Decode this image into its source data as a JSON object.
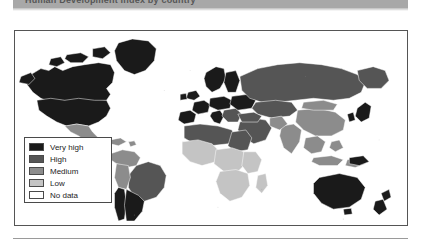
{
  "figure": {
    "banner_title": "Human Development Index by country",
    "banner_color": "#a8a8a8"
  },
  "legend": {
    "title": "",
    "items": [
      {
        "label": "Very high",
        "color": "#1a1a1a"
      },
      {
        "label": "High",
        "color": "#555555"
      },
      {
        "label": "Medium",
        "color": "#8c8c8c"
      },
      {
        "label": "Low",
        "color": "#c4c4c4"
      },
      {
        "label": "No data",
        "color": "#ffffff"
      }
    ]
  },
  "map": {
    "projection": "equirectangular",
    "frame_color": "#555555",
    "ocean_color": "#ffffff",
    "border_color": "#ffffff",
    "regions": [
      {
        "name": "canada",
        "class": "very-high"
      },
      {
        "name": "united-states",
        "class": "very-high"
      },
      {
        "name": "greenland",
        "class": "very-high"
      },
      {
        "name": "mexico",
        "class": "medium"
      },
      {
        "name": "central-america",
        "class": "medium"
      },
      {
        "name": "brazil",
        "class": "high"
      },
      {
        "name": "argentina",
        "class": "very-high"
      },
      {
        "name": "chile",
        "class": "very-high"
      },
      {
        "name": "bolivia",
        "class": "medium"
      },
      {
        "name": "western-europe",
        "class": "very-high"
      },
      {
        "name": "scandinavia",
        "class": "very-high"
      },
      {
        "name": "russia",
        "class": "high"
      },
      {
        "name": "china",
        "class": "medium"
      },
      {
        "name": "india",
        "class": "medium"
      },
      {
        "name": "north-africa",
        "class": "high"
      },
      {
        "name": "sub-saharan-africa",
        "class": "low"
      },
      {
        "name": "middle-east",
        "class": "high"
      },
      {
        "name": "southeast-asia",
        "class": "medium"
      },
      {
        "name": "australia",
        "class": "very-high"
      },
      {
        "name": "new-zealand",
        "class": "very-high"
      },
      {
        "name": "japan",
        "class": "very-high"
      }
    ]
  }
}
